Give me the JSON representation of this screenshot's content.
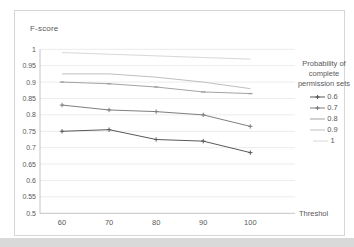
{
  "chart_data": {
    "type": "line",
    "title": "F-score",
    "xlabel": "Threshol",
    "ylabel": "F-score",
    "x": [
      60,
      70,
      80,
      90,
      100
    ],
    "xticks": [
      "60",
      "70",
      "80",
      "90",
      "100"
    ],
    "yticks": [
      "1",
      "0.95",
      "0.9",
      "0.85",
      "0.8",
      "0.75",
      "0.7",
      "0.65",
      "0.6",
      "0.55",
      "0.5"
    ],
    "ylim": [
      0.5,
      1.0
    ],
    "grid": true,
    "legend_position": "right",
    "legend_title": "Probability of complete permission sets",
    "series": [
      {
        "name": "0.6",
        "values": [
          0.75,
          0.755,
          0.725,
          0.72,
          0.685
        ],
        "color": "#595959",
        "marker": "plus"
      },
      {
        "name": "0.7",
        "values": [
          0.83,
          0.815,
          0.81,
          0.8,
          0.765
        ],
        "color": "#7f7f7f",
        "marker": "plus"
      },
      {
        "name": "0.8",
        "values": [
          0.9,
          0.895,
          0.885,
          0.87,
          0.865
        ],
        "color": "#a3a3a3",
        "marker": "dash"
      },
      {
        "name": "0.9",
        "values": [
          0.925,
          0.925,
          0.915,
          0.9,
          0.88
        ],
        "color": "#bfbfbf",
        "marker": "none"
      },
      {
        "name": "1",
        "values": [
          0.99,
          0.985,
          0.98,
          0.975,
          0.97
        ],
        "color": "#d8d8d8",
        "marker": "none"
      }
    ],
    "colors": {
      "grid": "#ececec",
      "axis": "#c4c4c4",
      "text": "#595959"
    }
  },
  "page": {
    "bottom_strip_color": "#d9d9d9"
  }
}
